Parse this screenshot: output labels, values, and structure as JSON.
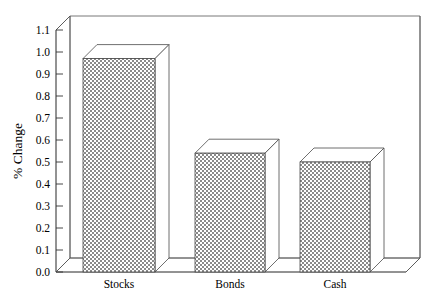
{
  "chart_data": {
    "type": "bar",
    "title": "",
    "subtitle": "",
    "xlabel": "",
    "ylabel": "% Change",
    "categories": [
      "Stocks",
      "Bonds",
      "Cash"
    ],
    "values": [
      0.97,
      0.54,
      0.5
    ],
    "series": [
      {
        "name": "% Change",
        "values": [
          0.97,
          0.54,
          0.5
        ]
      }
    ],
    "ylim": [
      0.0,
      1.1
    ],
    "ytick_labels": [
      "0.0",
      "0.1",
      "0.2",
      "0.3",
      "0.4",
      "0.5",
      "0.6",
      "0.7",
      "0.8",
      "0.9",
      "1.0",
      "1.1"
    ],
    "ytick_values": [
      0.0,
      0.1,
      0.2,
      0.3,
      0.4,
      0.5,
      0.6,
      0.7,
      0.8,
      0.9,
      1.0,
      1.1
    ],
    "grid": false,
    "legend": false,
    "legend_position": "none",
    "style": {
      "three_d": true,
      "bar_fill": "checkerboard",
      "bar_fill_color": "#808080",
      "bar_edge_color": "#4a4a4a",
      "frame_color": "#555555",
      "background": "#ffffff",
      "text_color": "#000000"
    },
    "annotations": []
  }
}
